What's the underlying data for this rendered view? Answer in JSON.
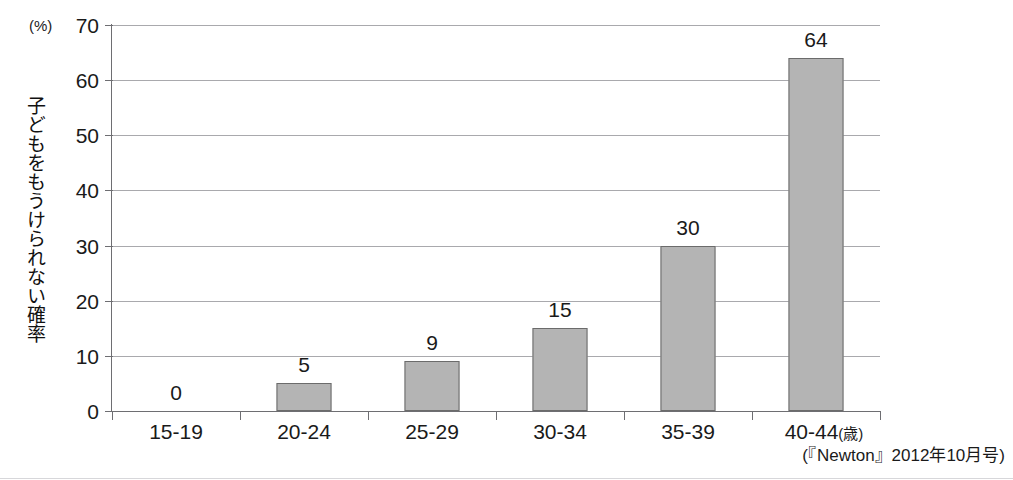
{
  "chart_data": {
    "type": "bar",
    "title": "",
    "xlabel": "",
    "ylabel": "子どもをもうけられない確率",
    "unit_label": "(%)",
    "x_unit_suffix": "(歳)",
    "categories": [
      "15-19",
      "20-24",
      "25-29",
      "30-34",
      "35-39",
      "40-44"
    ],
    "values": [
      0,
      5,
      9,
      15,
      30,
      64
    ],
    "value_labels": [
      "0",
      "5",
      "9",
      "15",
      "30",
      "64"
    ],
    "ylim": [
      0,
      70
    ],
    "ytick_labels": [
      "0",
      "10",
      "20",
      "30",
      "40",
      "50",
      "60",
      "70"
    ],
    "yticks": [
      0,
      10,
      20,
      30,
      40,
      50,
      60,
      70
    ],
    "grid": true,
    "legend": "none",
    "series": [
      {
        "name": "子どもをもうけられない確率",
        "values": [
          0,
          5,
          9,
          15,
          30,
          64
        ]
      }
    ],
    "colors": {
      "bar_fill": "#b4b4b4",
      "bar_border": "#6b6b6b",
      "gridline": "#a9a9ad",
      "axis": "#6e6e72",
      "text": "#1a1a1a"
    }
  },
  "source_note": "(『Newton』2012年10月号)",
  "top_clipped_caption": ""
}
